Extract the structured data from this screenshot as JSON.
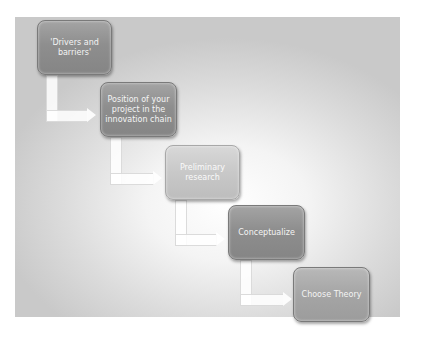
{
  "diagram": {
    "type": "staircase-process",
    "steps": [
      {
        "label": "'Drivers and barriers'"
      },
      {
        "label": "Position of your project in the innovation chain"
      },
      {
        "label": "Preliminary research"
      },
      {
        "label": "Conceptualize"
      },
      {
        "label": "Choose Theory"
      }
    ],
    "colors": {
      "box_fill": "#8e8e8e",
      "box_text": "#f4f4f4",
      "background_center": "#ffffff",
      "background_edge": "#c9c9c9",
      "arrow": "#ffffff"
    }
  }
}
